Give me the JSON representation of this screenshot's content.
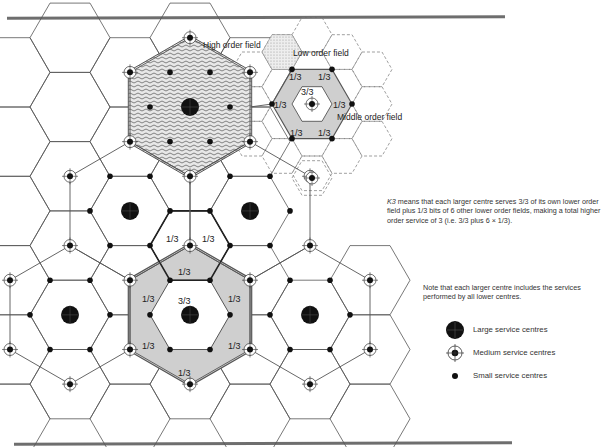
{
  "figure": {
    "labels": {
      "high_order_field": "High order field",
      "low_order_field": "Low order field",
      "middle_order_field": "Middle order field"
    },
    "fractions": {
      "inset": {
        "centre": "3/3",
        "share": "1/3"
      },
      "main": {
        "centre": "3/3",
        "share": "1/3"
      }
    },
    "explanation": {
      "lead": "K3",
      "text": " means that each larger centre serves 3/3 of its own lower order field plus 1/3 bits of 6 other lower order fields, making a total higher order service of 3 (i.e. 3/3 plus 6 × 1/3)."
    },
    "note": "Note that each larger centre includes the services performed by all lower centres.",
    "legend": [
      {
        "symbol": "large-centre",
        "label": "Large service centres"
      },
      {
        "symbol": "medium-centre",
        "label": "Medium service centres"
      },
      {
        "symbol": "small-centre",
        "label": "Small service centres"
      }
    ],
    "colors": {
      "line": "#555555",
      "shade": "#cfcfcf",
      "dark_shade": "#9a9a9a",
      "dot": "#111111",
      "rule": "#6e6e6e"
    },
    "geometry": {
      "origin": [
        190,
        107
      ],
      "hex_radius": 40,
      "large_centres_axial": [
        [
          0,
          0
        ],
        [
          -1,
          2
        ],
        [
          1,
          1
        ],
        [
          -2,
          4
        ],
        [
          0,
          3
        ],
        [
          2,
          2
        ]
      ],
      "inset_centre": [
        312,
        104
      ],
      "inset_dashed_centre": [
        312,
        178
      ]
    }
  }
}
